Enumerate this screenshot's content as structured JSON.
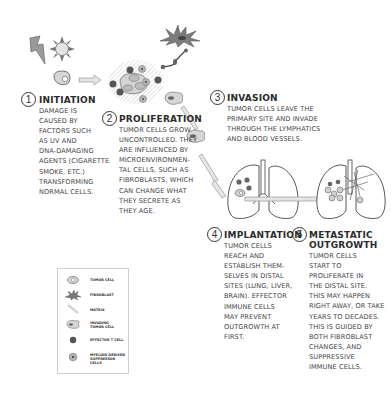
{
  "diagram": {
    "title": "",
    "colors": {
      "ink": "#333333",
      "cell_fill": "#d9d9d9",
      "cell_dark": "#555555",
      "arrow_fill": "#e6e6e6",
      "hatch": "#cccccc"
    },
    "steps": [
      {
        "number": "1",
        "title": "INITIATION",
        "body": "DAMAGE IS\nCAUSED BY\nFACTORS SUCH\nAS UV AND\nDNA-DAMAGING\nAGENTS (CIGARETTE\nSMOKE, ETC.)\nTRANSFORMING\nNORMAL CELLS."
      },
      {
        "number": "2",
        "title": "PROLIFERATION",
        "body": "TUMOR CELLS GROW\nUNCONTROLLED. THEY\nARE INFLUENCED BY\nMICROENVIRONMEN-\nTAL CELLS, SUCH AS\nFIBROBLASTS, WHICH\nCAN CHANGE WHAT\nTHEY SECRETE AS\nTHEY AGE."
      },
      {
        "number": "3",
        "title": "INVASION",
        "body": "TUMOR CELLS LEAVE THE\nPRIMARY SITE AND INVADE\nTHROUGH THE LYMPHATICS\nAND BLOOD VESSELS."
      },
      {
        "number": "4",
        "title": "IMPLANTATION",
        "body": "TUMOR CELLS\nREACH AND\nESTABLISH THEM-\nSELVES IN DISTAL\nSITES (LUNG, LIVER,\nBRAIN). EFFECTOR\nIMMUNE CELLS\nMAY PREVENT\nOUTGROWTH AT\nFIRST."
      },
      {
        "number": "5",
        "title": "METASTATIC\nOUTGROWTH",
        "body": "TUMOR CELLS\nSTART TO\nPROLIFERATE IN\nTHE DISTAL SITE.\nTHIS MAY HAPPEN\nRIGHT AWAY, OR TAKE\nYEARS TO DECADES.\nTHIS IS GUIDED BY\nBOTH FIBROBLAST\nCHANGES, AND\nSUPPRESSIVE\nIMMUNE CELLS."
      }
    ],
    "legend": {
      "items": [
        {
          "icon": "tumor-cell-icon",
          "label": "TUMOR CELL"
        },
        {
          "icon": "fibroblast-icon",
          "label": "FIBROBLAST"
        },
        {
          "icon": "matrix-icon",
          "label": "MATRIX"
        },
        {
          "icon": "invading-tumor-cell-icon",
          "label": "INVADING\nTUMOR CELL"
        },
        {
          "icon": "effector-t-cell-icon",
          "label": "EFFECTOR T CELL"
        },
        {
          "icon": "myeloid-suppressor-cell-icon",
          "label": "MYELOID DERIVED\nSUPPRESSOR CELLS"
        }
      ]
    },
    "illustrations": [
      "lightning-bolt-icon",
      "sun-uv-icon",
      "normal-cell-icon",
      "tumor-cluster",
      "fibroblast",
      "invading-tumor-cells",
      "lungs-implantation",
      "lungs-metastatic-outgrowth"
    ]
  }
}
